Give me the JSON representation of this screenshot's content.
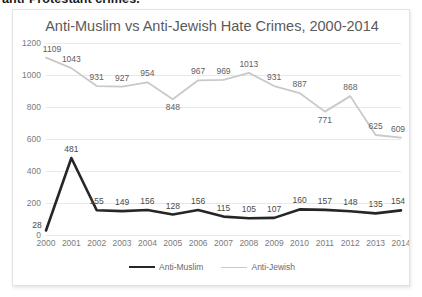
{
  "document": {
    "cut_off_line": "anti-Protestant crimes."
  },
  "chart_data": {
    "type": "line",
    "title": "Anti-Muslim vs Anti-Jewish Hate Crimes, 2000-2014",
    "xlabel": "",
    "ylabel": "",
    "categories": [
      "2000",
      "2001",
      "2002",
      "2003",
      "2004",
      "2005",
      "2006",
      "2007",
      "2008",
      "2009",
      "2010",
      "2011",
      "2012",
      "2013",
      "2014"
    ],
    "ylim": [
      0,
      1200
    ],
    "yticks": [
      "0",
      "200",
      "400",
      "600",
      "800",
      "1000",
      "1200"
    ],
    "grid": true,
    "legend_position": "bottom",
    "series": [
      {
        "name": "Anti-Muslim",
        "color": "#262626",
        "values": [
          28,
          481,
          155,
          149,
          156,
          128,
          156,
          115,
          105,
          107,
          160,
          157,
          148,
          135,
          154
        ]
      },
      {
        "name": "Anti-Jewish",
        "color": "#c9c9c9",
        "values": [
          1109,
          1043,
          931,
          927,
          954,
          848,
          967,
          969,
          1013,
          931,
          887,
          771,
          868,
          625,
          609
        ]
      }
    ]
  }
}
